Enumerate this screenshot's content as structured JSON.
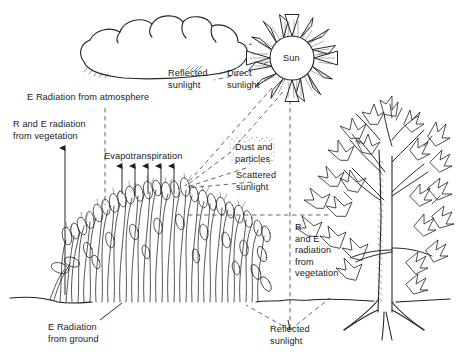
{
  "figure": {
    "background_color": "#ffffff",
    "ink_color": "#1a1a1a"
  },
  "labels": {
    "e_radiation_atmosphere": "E Radiation from atmosphere",
    "r_and_e_radiation_vegetation_left": "R and E radiation\nfrom vegetation",
    "evapotranspiration": "Evapotranspiration",
    "reflected_sunlight_cloud": "Reflected\nsunlight",
    "direct_sunlight": "Direct\nsunlight",
    "dust_and_particles": "Dust and\nparticles",
    "scattered_sunlight": "Scattered\nsunlight",
    "sun": "Sun",
    "r_and_e_radiation_vegetation_right": "R\nand E\nradiation\nfrom\nvegetation",
    "e_radiation_ground": "E Radiation\nfrom ground",
    "reflected_sunlight_ground": "Reflected\nsunlight"
  },
  "elements": {
    "cloud": "cloud-shape",
    "sun": "sun-with-rays",
    "grass": "grass-vegetation-clump",
    "tree": "broadleaf-tree",
    "ground": "ground-line",
    "dust_cloud": "stippled-dust-cloud",
    "evapotranspiration_arrows": 5,
    "sun_ray_count": 16
  },
  "colors": {
    "ink": "#1a1a1a",
    "line": "#262626",
    "background": "#ffffff",
    "dashed": "#555555"
  }
}
